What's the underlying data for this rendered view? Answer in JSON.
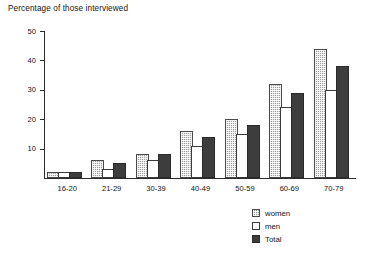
{
  "chart_data": {
    "type": "bar",
    "title": "Percentage of those interviewed",
    "xlabel": "",
    "ylabel": "",
    "ylim": [
      0,
      50
    ],
    "yticks": [
      10,
      20,
      30,
      40,
      50
    ],
    "grid": false,
    "legend_position": "bottom-right",
    "categories": [
      "16-20",
      "21-29",
      "30-39",
      "40-49",
      "50-59",
      "60-69",
      "70-79"
    ],
    "series": [
      {
        "name": "women",
        "fill": "hatched-gray",
        "color": "#9d9d9d",
        "values": [
          2,
          6,
          8,
          16,
          20,
          32,
          44
        ]
      },
      {
        "name": "men",
        "fill": "white",
        "color": "#ffffff",
        "values": [
          2,
          3,
          6,
          11,
          15,
          24,
          30
        ]
      },
      {
        "name": "Total",
        "fill": "solid-dark",
        "color": "#3d3d3d",
        "values": [
          2,
          5,
          8,
          14,
          18,
          29,
          38
        ]
      }
    ]
  },
  "legend": {
    "items": [
      {
        "label": "women"
      },
      {
        "label": "men"
      },
      {
        "label": "Total"
      }
    ]
  }
}
